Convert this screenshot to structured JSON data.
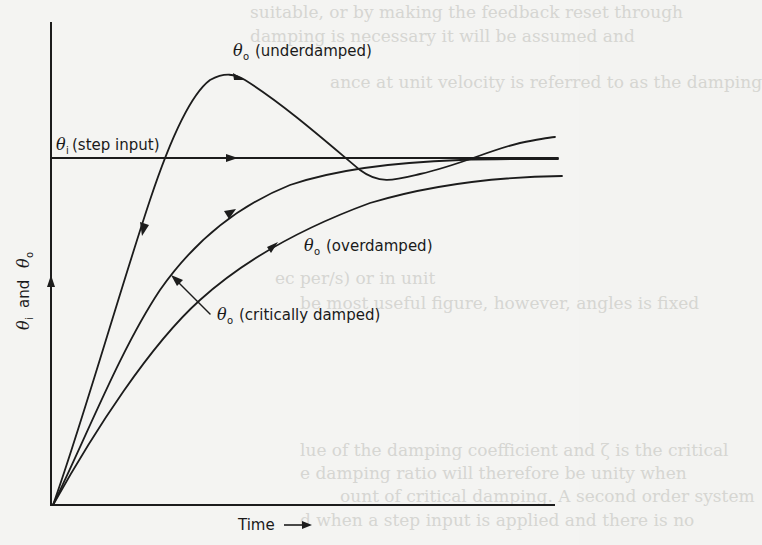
{
  "figure": {
    "type": "step-response-diagram",
    "axes": {
      "y_label": {
        "symbol_1": "θ",
        "sub_1": "i",
        "conj": "and",
        "symbol_2": "θ",
        "sub_2": "o"
      },
      "x_label": "Time",
      "x_arrow": "⟶"
    },
    "curves": [
      {
        "id": "step-input",
        "symbol": "θ",
        "sub": "i",
        "label": "(step input)"
      },
      {
        "id": "underdamped",
        "symbol": "θ",
        "sub": "o",
        "label": "(underdamped)"
      },
      {
        "id": "critically-damped",
        "symbol": "θ",
        "sub": "o",
        "label": "(critically damped)"
      },
      {
        "id": "overdamped",
        "symbol": "θ",
        "sub": "o",
        "label": "(overdamped)"
      }
    ],
    "colors": {
      "ink": "#1c1c1c",
      "paper": "#f4f4f2",
      "bleed_through": "#d6d6d2"
    }
  },
  "bleed_through_text": [
    "suitable, or by making the feedback reset through",
    "damping is necessary it will be assumed and",
    "ance at unit velocity is referred to as the damping",
    "ec per/s) or in unit",
    "be most useful figure, however, angles is fixed",
    "lue of the damping coefficient and ζ is the critical",
    "e damping ratio will therefore be unity when",
    "ount of critical damping. A second order system",
    "d when a step input is applied and there is no"
  ]
}
